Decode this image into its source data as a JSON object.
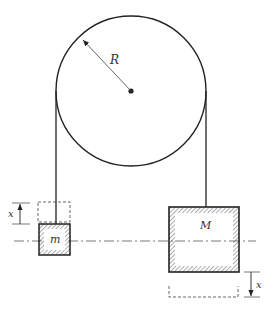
{
  "diagram": {
    "pulley": {
      "label": "R",
      "cx": 131,
      "cy": 91,
      "r": 75
    },
    "mass_small": {
      "label": "m",
      "x": 39,
      "y": 224,
      "w": 31,
      "h": 31
    },
    "mass_large": {
      "label": "M",
      "x": 169,
      "y": 207,
      "w": 70,
      "h": 65
    },
    "displacement_left": {
      "label": "x",
      "direction": "up"
    },
    "displacement_right": {
      "label": "x",
      "direction": "down"
    },
    "colors": {
      "line": "#222222",
      "hatch": "#444444",
      "dash": "#555555"
    }
  }
}
